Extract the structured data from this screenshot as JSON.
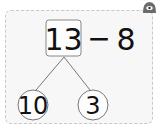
{
  "problem": {
    "minuend": "13",
    "operator": "−",
    "subtrahend": "8"
  },
  "number_bond": {
    "whole": "13",
    "parts": [
      "10",
      "3"
    ]
  },
  "icons": {
    "top_right": "view-eye-icon"
  },
  "colors": {
    "card_bg": "#f7f7f7",
    "card_border": "#c8c8c8",
    "icon": "#6b6b6b",
    "text": "#111111"
  }
}
